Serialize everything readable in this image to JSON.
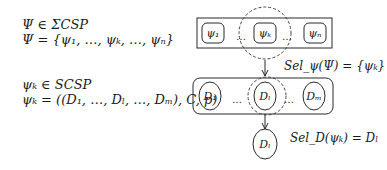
{
  "left_text": {
    "line1": "Ψ ∈ ΣCSP",
    "line2": "Ψ = {ψ₁, …, ψₖ, …, ψₙ}",
    "line3": "ψₖ ∈ SCSP",
    "line4": "ψₖ = ((D₁, …, Dₗ, …, Dₘ), C, p)"
  },
  "top_row": {
    "items": [
      "ψ₁",
      "ψₖ",
      "ψₙ"
    ],
    "ellipsis": "…",
    "selected_index": 1
  },
  "selection1_label": "Sel_ψ(Ψ) = {ψₖ}",
  "middle_row": {
    "items": [
      "D₁",
      "Dₗ",
      "Dₘ"
    ],
    "ellipsis": "…",
    "selected_index": 1
  },
  "selection2_label": "Sel_D(ψₖ) = Dₗ",
  "result_node": "Dₗ",
  "colors": {
    "stroke": "#2a2a2a",
    "dash": "#444444",
    "background": "#ffffff"
  }
}
